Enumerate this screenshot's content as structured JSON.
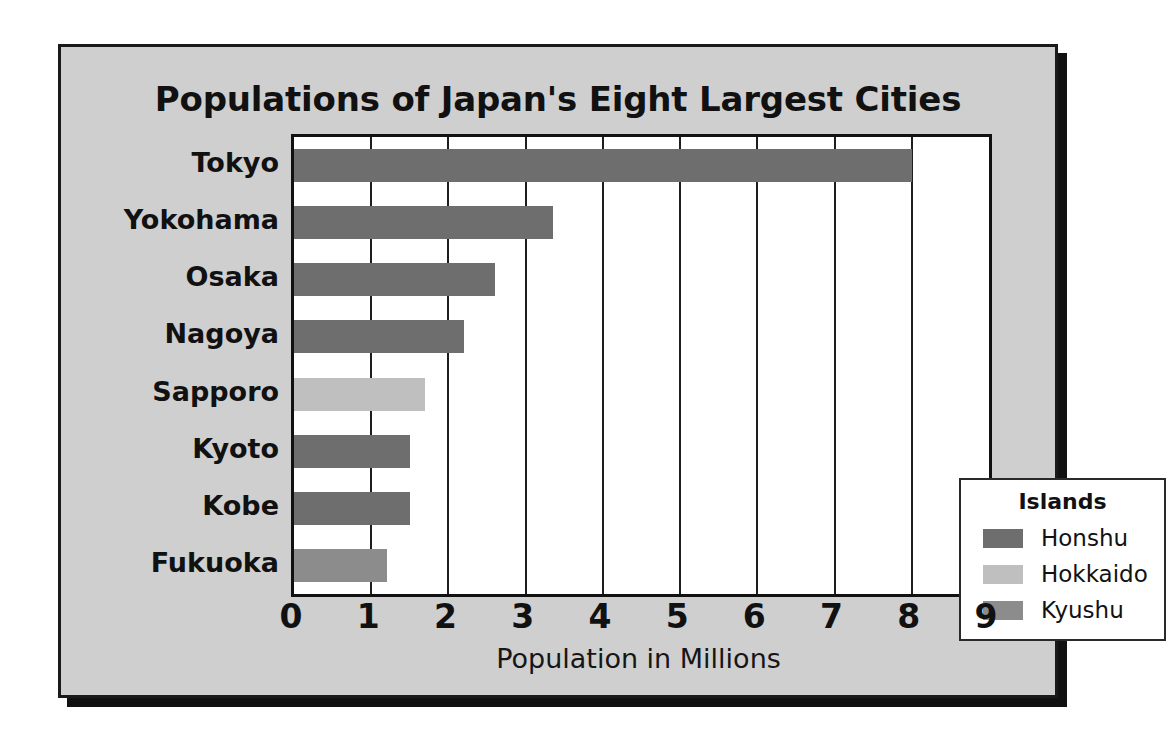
{
  "chart_data": {
    "type": "bar",
    "orientation": "horizontal",
    "title": "Populations of Japan's Eight Largest Cities",
    "xlabel": "Population in Millions",
    "ylabel": "",
    "xlim": [
      0,
      9
    ],
    "xticks": [
      "0",
      "1",
      "2",
      "3",
      "4",
      "5",
      "6",
      "7",
      "8",
      "9"
    ],
    "grid": true,
    "categories": [
      "Tokyo",
      "Yokohama",
      "Osaka",
      "Nagoya",
      "Sapporo",
      "Kyoto",
      "Kobe",
      "Fukuoka"
    ],
    "values": [
      8.0,
      3.35,
      2.6,
      2.2,
      1.7,
      1.5,
      1.5,
      1.2
    ],
    "groups": [
      "Honshu",
      "Honshu",
      "Honshu",
      "Honshu",
      "Hokkaido",
      "Honshu",
      "Honshu",
      "Kyushu"
    ],
    "legend": {
      "title": "Islands",
      "position": "inside-right-middle",
      "entries": [
        {
          "label": "Honshu",
          "color": "#6e6e6e"
        },
        {
          "label": "Hokkaido",
          "color": "#bfbfbf"
        },
        {
          "label": "Kyushu",
          "color": "#8c8c8c"
        }
      ]
    },
    "colors": {
      "Honshu": "#6e6e6e",
      "Hokkaido": "#bfbfbf",
      "Kyushu": "#8c8c8c",
      "plot_background": "#ffffff",
      "panel_background": "#cfcfcf",
      "axis": "#111111"
    }
  }
}
